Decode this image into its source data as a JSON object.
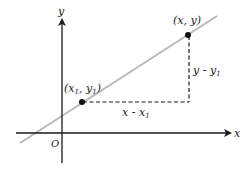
{
  "diagram": {
    "title": "",
    "colors": {
      "axis": "#1a1a1a",
      "line": "#b8b8b8",
      "dash": "#1a1a1a",
      "point": "#111111",
      "background": "#ffffff"
    },
    "axes": {
      "x_label": "x",
      "y_label": "y",
      "origin_label": "O"
    },
    "points": [
      {
        "id": "p1",
        "label_open": "(x",
        "label_sub1": "1",
        "label_mid": ", y",
        "label_sub2": "1",
        "label_close": ")"
      },
      {
        "id": "p2",
        "label": "(x, y)"
      }
    ],
    "segments": {
      "horizontal": {
        "label_main": "x - x",
        "label_sub": "1"
      },
      "vertical": {
        "label_main": "y - y",
        "label_sub": "1"
      }
    }
  }
}
